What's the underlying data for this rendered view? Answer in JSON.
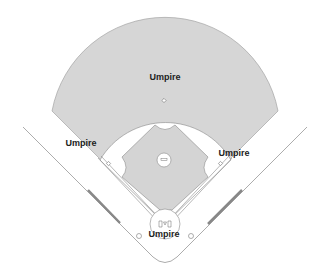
{
  "diagram": {
    "colors": {
      "grass": "#d4d4d4",
      "infield": "#d4d4d4",
      "line": "#777777",
      "text": "#222222"
    },
    "labels": [
      {
        "id": "umpire-second-base",
        "text": "Umpire",
        "x": 165,
        "y": 72
      },
      {
        "id": "umpire-third-base",
        "text": "Umpire",
        "x": 80,
        "y": 138
      },
      {
        "id": "umpire-first-base",
        "text": "Umpire",
        "x": 234,
        "y": 148
      },
      {
        "id": "umpire-home-plate",
        "text": "Umpire",
        "x": 164,
        "y": 229
      }
    ]
  }
}
